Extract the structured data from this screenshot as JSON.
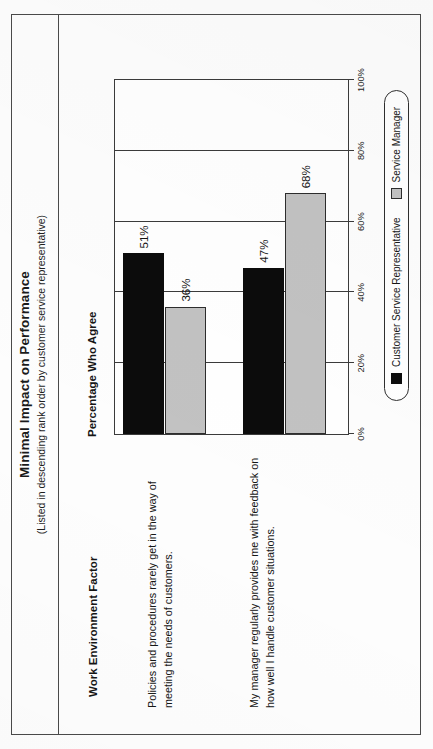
{
  "page": {
    "title": "Minimal Impact on Performance",
    "subtitle": "(Listed in descending rank order by customer service representative)"
  },
  "columns": {
    "factor_header": "Work Environment Factor",
    "percentage_header": "Percentage Who Agree"
  },
  "legend": {
    "items": [
      {
        "label": "Customer Service Representative",
        "color": "#0c0c0c",
        "key": "csr"
      },
      {
        "label": "Service Manager",
        "color": "#c2c2c2",
        "key": "sm"
      }
    ]
  },
  "chart_data": {
    "type": "bar",
    "orientation": "horizontal",
    "title": "Minimal Impact on Performance",
    "subtitle": "(Listed in descending rank order by customer service representative)",
    "xlabel": "Percentage Who Agree",
    "ylabel": "Work Environment Factor",
    "xlim": [
      0,
      100
    ],
    "grid": true,
    "legend_position": "bottom",
    "tick_labels": [
      "0%",
      "20%",
      "40%",
      "60%",
      "80%",
      "100%"
    ],
    "tick_values": [
      0,
      20,
      40,
      60,
      80,
      100
    ],
    "categories": [
      "Policies and procedures rarely get in the way of meeting the needs of customers.",
      "My manager regularly provides me with feedback on how well I handle customer situations."
    ],
    "series": [
      {
        "name": "Customer Service Representative",
        "color": "#0c0c0c",
        "values": [
          51,
          36
        ],
        "labels": [
          "51%",
          "47%"
        ]
      },
      {
        "name": "Service Manager",
        "color": "#c2c2c2",
        "values": [
          36,
          68
        ],
        "labels": [
          "36%",
          "68%"
        ]
      }
    ],
    "bars": [
      {
        "category_index": 0,
        "series": "Customer Service Representative",
        "value": 51,
        "label": "51%"
      },
      {
        "category_index": 0,
        "series": "Service Manager",
        "value": 36,
        "label": "36%"
      },
      {
        "category_index": 1,
        "series": "Customer Service Representative",
        "value": 47,
        "label": "47%"
      },
      {
        "category_index": 1,
        "series": "Service Manager",
        "value": 68,
        "label": "68%"
      }
    ]
  }
}
